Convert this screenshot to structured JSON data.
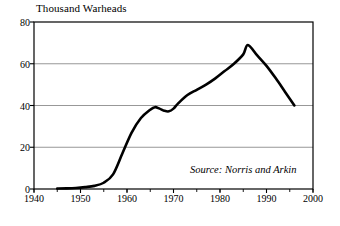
{
  "chart_data": {
    "type": "line",
    "title": "",
    "ylabel": "Thousand Warheads",
    "xlabel": "",
    "xlim": [
      1940,
      2000
    ],
    "ylim": [
      0,
      80
    ],
    "grid": true,
    "legend_position": "none",
    "yticks": [
      0,
      20,
      40,
      60,
      80
    ],
    "xticks": [
      1940,
      1950,
      1960,
      1970,
      1980,
      1990,
      2000
    ],
    "xtick_labels": [
      "1940",
      "1950",
      "1960",
      "1970",
      "1980",
      "1990",
      "2000"
    ],
    "ytick_labels": [
      "0",
      "20",
      "40",
      "60",
      "80"
    ],
    "x_minor_tick_step": 5,
    "annotation": "Source: Norris and Arkin",
    "series": [
      {
        "name": "Total nuclear warheads",
        "color": "#000000",
        "x": [
          1945,
          1947,
          1949,
          1951,
          1953,
          1955,
          1957,
          1959,
          1961,
          1963,
          1965,
          1966,
          1967,
          1968,
          1969,
          1970,
          1971,
          1973,
          1975,
          1977,
          1979,
          1981,
          1983,
          1985,
          1986,
          1988,
          1990,
          1992,
          1994,
          1996
        ],
        "values": [
          0.2,
          0.3,
          0.5,
          0.9,
          1.5,
          3.0,
          7.0,
          17.0,
          27.0,
          34.0,
          38.0,
          39.2,
          38.5,
          37.5,
          37.2,
          38.5,
          41.0,
          45.0,
          47.5,
          50.0,
          53.0,
          56.5,
          60.0,
          64.5,
          69.0,
          64.0,
          59.0,
          53.0,
          46.5,
          40.0
        ]
      }
    ]
  },
  "figure": {
    "plot_area": {
      "left": 34,
      "top": 22,
      "right": 313,
      "bottom": 189
    },
    "frame_color": "#000000",
    "grid_color": "#8c8c8c",
    "background": "#ffffff"
  }
}
